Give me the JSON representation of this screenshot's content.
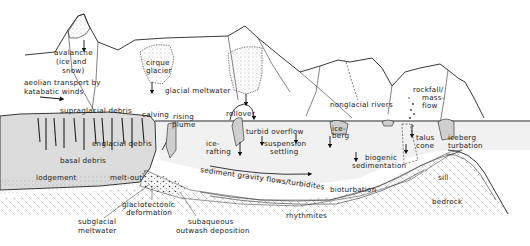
{
  "figure": {
    "type": "schematic cross-section"
  },
  "labels": {
    "avalanche": [
      "avalanche",
      "(ice and",
      "snow)"
    ],
    "aeolian": [
      "aeolian transport by",
      "katabatic winds"
    ],
    "cirque_glacier_left": [
      "cirque",
      "glacier"
    ],
    "glacial_meltwater": "glacial meltwater",
    "nonglacial_rivers": "nonglacial rivers",
    "rockfall": [
      "rockfall/",
      "mass-",
      "flow"
    ],
    "supraglacial_debris": "supraglacial debris",
    "calving": "calving",
    "englacial_debris": "englacial debris",
    "basal_debris": "basal debris",
    "lodgement": "lodgement",
    "melt_out": "melt-out",
    "rising_plume": [
      "rising",
      "plume"
    ],
    "rollover": "rollover",
    "turbid_overflow": "turbid overflow",
    "suspension_settling": [
      "suspension",
      "settling"
    ],
    "ice_rafting": [
      "ice-",
      "rafting"
    ],
    "ice_berg": [
      "ice-",
      "berg"
    ],
    "sediment_gravity_flows": "sediment gravity flows/turbidites",
    "talus_cone": [
      "talus",
      "cone"
    ],
    "iceberg_turbation": [
      "iceberg",
      "turbation"
    ],
    "biogenic_sedimentation": [
      "biogenic",
      "sedimentation"
    ],
    "bioturbation": "bioturbation",
    "rhythmites": "rhythmites",
    "sill": "sill",
    "bedrock": "bedrock",
    "subglacial_meltwater": [
      "subglacial",
      "meltwater"
    ],
    "glaciotectonic": [
      "glaciotectonic",
      "deformation"
    ],
    "subaqueous": [
      "subaqueous",
      "outwash deposition"
    ]
  },
  "colors": {
    "line": "#222222",
    "ice_fill": "#d9d9d9",
    "water_fill": "#ececec",
    "stipple": "#555555",
    "bedrock_cross": "#777777"
  }
}
